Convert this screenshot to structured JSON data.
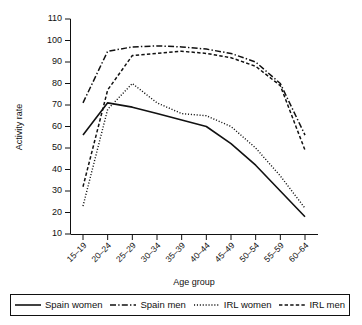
{
  "chart_data": {
    "type": "line",
    "title": "",
    "xlabel": "Age group",
    "ylabel": "Activity rate",
    "categories": [
      "15–19",
      "20–24",
      "25–29",
      "30–34",
      "35–39",
      "40–44",
      "45–49",
      "50–54",
      "55–59",
      "60–64"
    ],
    "ylim": [
      10,
      110
    ],
    "yticks": [
      10,
      20,
      30,
      40,
      50,
      60,
      70,
      80,
      90,
      100,
      110
    ],
    "grid": false,
    "legend_position": "bottom",
    "series": [
      {
        "name": "Spain women",
        "style": "solid",
        "values": [
          56,
          71,
          69,
          66,
          63,
          60,
          52,
          42,
          30,
          18
        ]
      },
      {
        "name": "Spain men",
        "style": "dash-dot",
        "values": [
          71,
          95,
          97,
          97.5,
          97,
          96,
          94,
          90,
          80,
          56
        ]
      },
      {
        "name": "IRL women",
        "style": "dotted",
        "values": [
          23,
          68,
          80,
          71,
          66,
          65,
          60,
          50,
          37,
          22
        ]
      },
      {
        "name": "IRL men",
        "style": "dashed",
        "values": [
          32,
          77,
          93,
          94,
          95,
          94,
          92,
          88,
          79,
          49
        ]
      }
    ]
  },
  "legend": {
    "items": [
      {
        "label": "Spain women",
        "style": "solid"
      },
      {
        "label": "Spain men",
        "style": "dash-dot"
      },
      {
        "label": "IRL women",
        "style": "dotted"
      },
      {
        "label": "IRL men",
        "style": "dashed"
      }
    ]
  }
}
